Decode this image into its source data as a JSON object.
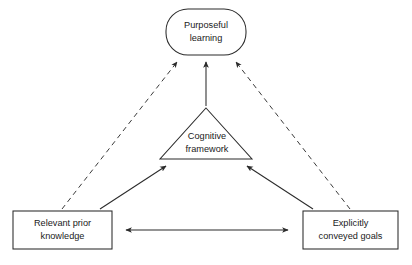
{
  "diagram": {
    "background_color": "#ffffff",
    "stroke_color": "#2b2b2b",
    "text_color": "#1a1a1a",
    "nodes": [
      {
        "id": "purposeful-learning",
        "shape": "rounded-rectangle",
        "line1": "Purposeful",
        "line2": "learning",
        "x": 206,
        "y": 32,
        "width": 80,
        "height": 46
      },
      {
        "id": "cognitive-framework",
        "shape": "triangle",
        "line1": "Cognitive",
        "line2": "framework",
        "apex_x": 206,
        "apex_y": 108,
        "base_left_x": 160,
        "base_right_x": 252,
        "base_y": 159
      },
      {
        "id": "relevant-prior-knowledge",
        "shape": "rectangle",
        "line1": "Relevant prior",
        "line2": "knowledge",
        "left": 13,
        "top": 211,
        "width": 99,
        "height": 38
      },
      {
        "id": "explicitly-conveyed-goals",
        "shape": "rectangle",
        "line1": "Explicitly",
        "line2": "conveyed goals",
        "left": 303,
        "top": 211,
        "width": 95,
        "height": 38
      }
    ],
    "edges": [
      {
        "id": "prior-knowledge-to-purposeful-learning",
        "style": "dashed",
        "from": "relevant-prior-knowledge",
        "to": "purposeful-learning",
        "arrowheads": "end"
      },
      {
        "id": "cognitive-framework-to-purposeful-learning",
        "style": "solid",
        "from": "cognitive-framework",
        "to": "purposeful-learning",
        "arrowheads": "end"
      },
      {
        "id": "conveyed-goals-to-purposeful-learning",
        "style": "dashed",
        "from": "explicitly-conveyed-goals",
        "to": "purposeful-learning",
        "arrowheads": "end"
      },
      {
        "id": "prior-knowledge-to-cognitive-framework",
        "style": "solid",
        "from": "relevant-prior-knowledge",
        "to": "cognitive-framework",
        "arrowheads": "end"
      },
      {
        "id": "conveyed-goals-to-cognitive-framework",
        "style": "solid",
        "from": "explicitly-conveyed-goals",
        "to": "cognitive-framework",
        "arrowheads": "end"
      },
      {
        "id": "prior-knowledge-to-conveyed-goals",
        "style": "solid",
        "from": "relevant-prior-knowledge",
        "to": "explicitly-conveyed-goals",
        "arrowheads": "both"
      }
    ]
  }
}
